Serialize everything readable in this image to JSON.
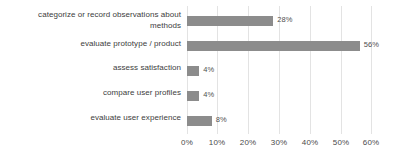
{
  "chart_data": {
    "type": "bar",
    "orientation": "horizontal",
    "title": "",
    "subtitle": "",
    "xlabel": "",
    "ylabel": "",
    "xlim": [
      0,
      60
    ],
    "grid": true,
    "legend": false,
    "legend_position": "none",
    "bar_color": "#8c8c8c",
    "gridline_color": "#e3e3e3",
    "label_color": "#3d3d3d",
    "value_suffix": "%",
    "categories": [
      "categorize or record observations about methods",
      "evaluate prototype / product",
      "assess satisfaction",
      "compare user profiles",
      "evaluate user experience"
    ],
    "values": [
      28,
      56,
      4,
      4,
      8
    ],
    "value_labels": [
      "28%",
      "56%",
      "4%",
      "4%",
      "8%"
    ],
    "x_ticks": [
      0,
      10,
      20,
      30,
      40,
      50,
      60
    ],
    "x_tick_labels": [
      "0%",
      "10%",
      "20%",
      "30%",
      "40%",
      "50%",
      "60%"
    ]
  }
}
